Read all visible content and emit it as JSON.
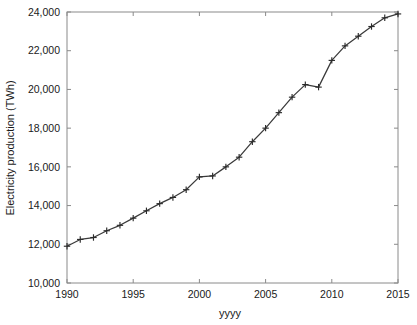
{
  "chart_data": {
    "type": "line",
    "title": "",
    "xlabel": "yyyy",
    "ylabel": "Electricity production (TWh)",
    "xlim": [
      1990,
      2015
    ],
    "ylim": [
      10000,
      24000
    ],
    "xticks": [
      1990,
      1995,
      2000,
      2005,
      2010,
      2015
    ],
    "xticklabels": [
      "1990",
      "1995",
      "2000",
      "2005",
      "2010",
      "2015"
    ],
    "yticks": [
      10000,
      12000,
      14000,
      16000,
      18000,
      20000,
      22000,
      24000
    ],
    "yticklabels": [
      "10,000",
      "12,000",
      "14,000",
      "16,000",
      "18,000",
      "20,000",
      "22,000",
      "24,000"
    ],
    "grid": false,
    "legend": false,
    "marker": "plus",
    "line_color": "#3a3a3a",
    "marker_color": "#2b2b2b",
    "axis_color": "#8a8a8a",
    "x": [
      1990,
      1991,
      1992,
      1993,
      1994,
      1995,
      1996,
      1997,
      1998,
      1999,
      2000,
      2001,
      2002,
      2003,
      2004,
      2005,
      2006,
      2007,
      2008,
      2009,
      2010,
      2011,
      2012,
      2013,
      2014,
      2015
    ],
    "values": [
      11900,
      12250,
      12350,
      12700,
      12980,
      13350,
      13730,
      14100,
      14420,
      14820,
      15480,
      15530,
      16000,
      16500,
      17300,
      18000,
      18800,
      19600,
      20250,
      20120,
      21500,
      22250,
      22750,
      23250,
      23700,
      23900
    ],
    "series": [
      {
        "name": "Electricity production",
        "values": [
          11900,
          12250,
          12350,
          12700,
          12980,
          13350,
          13730,
          14100,
          14420,
          14820,
          15480,
          15530,
          16000,
          16500,
          17300,
          18000,
          18800,
          19600,
          20250,
          20120,
          21500,
          22250,
          22750,
          23250,
          23700,
          23900
        ]
      }
    ]
  }
}
